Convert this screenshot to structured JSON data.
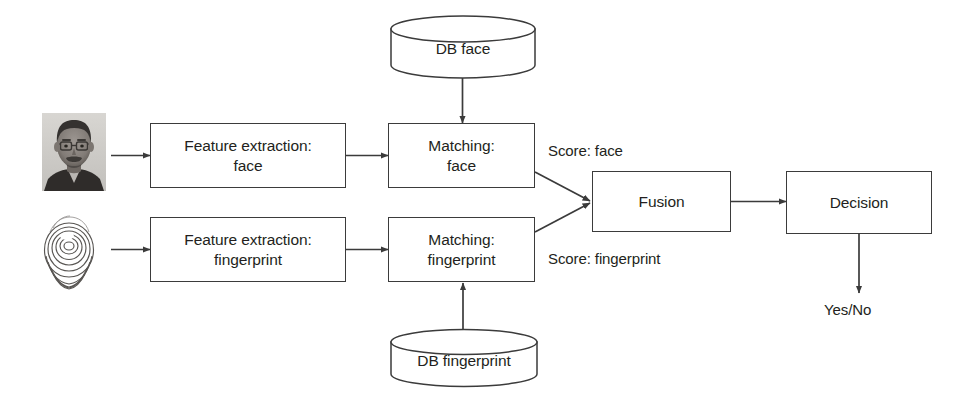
{
  "diagram": {
    "stroke_color": "#3b3b3b",
    "text_color": "#231f20",
    "background_color": "#ffffff"
  },
  "databases": [
    {
      "id": "db-face",
      "label": "DB face"
    },
    {
      "id": "db-fingerprint",
      "label": "DB fingerprint"
    }
  ],
  "samples": [
    {
      "id": "face-photo",
      "name": "face-photograph"
    },
    {
      "id": "fingerprint-image",
      "name": "fingerprint-impression"
    }
  ],
  "boxes": [
    {
      "id": "feature-extraction-face",
      "label": "Feature extraction:\nface"
    },
    {
      "id": "matching-face",
      "label": "Matching:\nface"
    },
    {
      "id": "feature-extraction-fingerprint",
      "label": "Feature extraction:\nfingerprint"
    },
    {
      "id": "matching-fingerprint",
      "label": "Matching:\nfingerprint"
    },
    {
      "id": "fusion",
      "label": "Fusion"
    },
    {
      "id": "decision",
      "label": "Decision"
    }
  ],
  "edge_labels": [
    {
      "id": "score-face",
      "label": "Score: face"
    },
    {
      "id": "score-fingerprint",
      "label": "Score: fingerprint"
    },
    {
      "id": "output",
      "label": "Yes/No"
    }
  ]
}
